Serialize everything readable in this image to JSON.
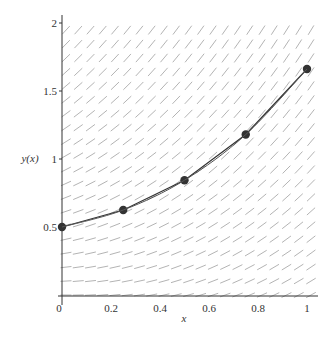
{
  "chart_data": {
    "type": "line",
    "title": "",
    "xlabel": "x",
    "ylabel": "y(x)",
    "xlim": [
      0,
      1
    ],
    "ylim": [
      0,
      2.05
    ],
    "x_ticks": [
      0,
      0.2,
      0.4,
      0.6,
      0.8,
      1
    ],
    "x_tick_labels": [
      "0",
      "0.2",
      "0.4",
      "0.6",
      "0.8",
      "1"
    ],
    "y_ticks": [
      0.5,
      1,
      1.5,
      2
    ],
    "y_tick_labels": [
      "0.5",
      "1",
      "1.5",
      "2"
    ],
    "grid": false,
    "legend": null,
    "slope_field": {
      "description": "direction field for dy/dx = x + y",
      "nx": 20,
      "ny": 20,
      "color": "#aaaaaa"
    },
    "series": [
      {
        "name": "Euler approximation (h = 0.25)",
        "style": "polyline-with-markers",
        "color": "#333333",
        "x": [
          0,
          0.25,
          0.5,
          0.75,
          1
        ],
        "y": [
          0.5,
          0.625,
          0.844,
          1.18,
          1.662
        ]
      },
      {
        "name": "smooth curve",
        "style": "line",
        "color": "#555555",
        "x": [
          0,
          0.25,
          0.5,
          0.75,
          1
        ],
        "y": [
          0.5,
          0.625,
          0.844,
          1.18,
          1.662
        ]
      }
    ]
  },
  "layout": {
    "x0_px": 62,
    "x1_px": 307,
    "y0_px": 295,
    "yunit_px": 136,
    "plot_top_px": 15,
    "plot_right_px": 318
  }
}
